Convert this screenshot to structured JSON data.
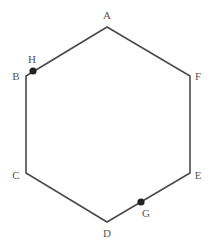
{
  "diagram": {
    "type": "hexagon",
    "stroke_color": "#4a4a4a",
    "point_color": "#222222",
    "vertices": [
      {
        "label": "A",
        "x": 107,
        "y": 27,
        "lx": 107,
        "ly": 19
      },
      {
        "label": "B",
        "x": 26,
        "y": 76,
        "lx": 16,
        "ly": 80
      },
      {
        "label": "C",
        "x": 26,
        "y": 173,
        "lx": 16,
        "ly": 179
      },
      {
        "label": "D",
        "x": 107,
        "y": 222,
        "lx": 107,
        "ly": 237
      },
      {
        "label": "E",
        "x": 190,
        "y": 173,
        "lx": 198,
        "ly": 179
      },
      {
        "label": "F",
        "x": 190,
        "y": 76,
        "lx": 198,
        "ly": 80
      }
    ],
    "points": [
      {
        "label": "H",
        "x": 33,
        "y": 71,
        "lx": 32,
        "ly": 63,
        "on_edge": "AB"
      },
      {
        "label": "G",
        "x": 141,
        "y": 202,
        "lx": 146,
        "ly": 217,
        "on_edge": "DE"
      }
    ]
  }
}
